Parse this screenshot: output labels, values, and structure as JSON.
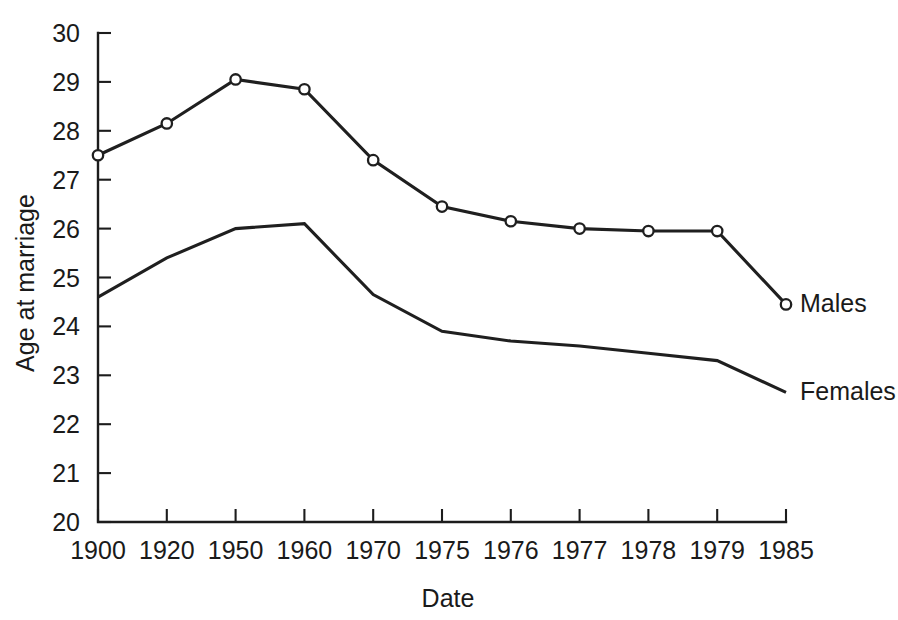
{
  "chart_data": {
    "type": "line",
    "title": "",
    "xlabel": "Date",
    "ylabel": "Age at marriage",
    "categories": [
      "1900",
      "1920",
      "1950",
      "1960",
      "1970",
      "1975",
      "1976",
      "1977",
      "1978",
      "1979",
      "1985"
    ],
    "xtick_labels": [
      "1900",
      "1920",
      "1950",
      "1960",
      "1970",
      "1975",
      "1976",
      "1977",
      "1978",
      "1979",
      "1985"
    ],
    "ytick_labels": [
      "30",
      "29",
      "28",
      "27",
      "26",
      "25",
      "24",
      "23",
      "22",
      "21",
      "20"
    ],
    "ylim": [
      20,
      30
    ],
    "ytick_values": [
      20,
      21,
      22,
      23,
      24,
      25,
      26,
      27,
      28,
      29,
      30
    ],
    "grid": false,
    "legend_position": "end-of-line-labels",
    "series": [
      {
        "name": "Males",
        "label": "Males",
        "markers": "open-circle",
        "values": [
          27.5,
          28.15,
          29.05,
          28.85,
          27.4,
          26.45,
          26.15,
          26.0,
          25.95,
          25.95,
          24.45
        ]
      },
      {
        "name": "Females",
        "label": "Females",
        "markers": "none",
        "values": [
          24.6,
          25.4,
          26.0,
          26.1,
          24.65,
          23.9,
          23.7,
          23.6,
          23.45,
          23.3,
          22.65
        ]
      }
    ]
  },
  "axes": {
    "y_axis_title": "Age at marriage",
    "x_axis_title": "Date"
  },
  "colors": {
    "line": "#1f1f1f",
    "axis": "#1c1c1c",
    "background": "#ffffff",
    "marker_fill": "#ffffff"
  }
}
